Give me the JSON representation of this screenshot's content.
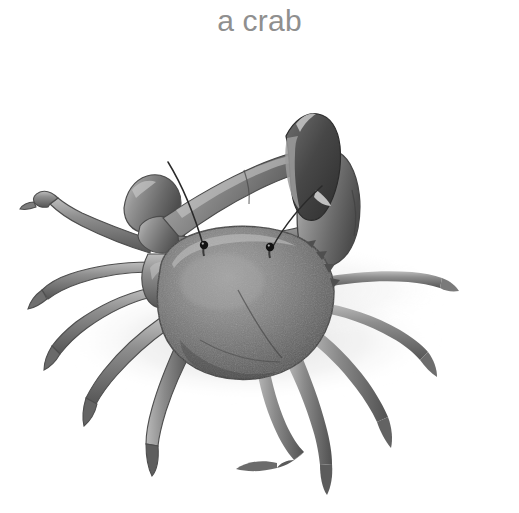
{
  "canvas": {
    "width": 519,
    "height": 513,
    "background_color": "#ffffff"
  },
  "caption": {
    "text": "a crab",
    "color": "#8f8f8f",
    "align": "center",
    "font_size_px": 30
  },
  "illustration": {
    "name": "crab-illustration",
    "subject": "crab",
    "style": "grayscale pencil / airbrush illustration",
    "orientation": "front three-quarter view, one large claw raised",
    "palette": {
      "background": "#ffffff",
      "ground_shadow": "#e9e9e9",
      "body_light": "#b6b6b6",
      "body_mid": "#8c8c8c",
      "body_dark": "#5f5f5f",
      "body_darkest": "#3a3a3a",
      "outline": "#4a4a4a",
      "eye": "#141414",
      "highlight": "#dddddd"
    },
    "parts": [
      {
        "name": "carapace",
        "label": "carapace"
      },
      {
        "name": "large-claw",
        "label": "large claw (chela)"
      },
      {
        "name": "small-claw",
        "label": "small claw"
      },
      {
        "name": "eye-left",
        "label": "left eye"
      },
      {
        "name": "eye-right",
        "label": "right eye"
      },
      {
        "name": "antenna-left",
        "label": "left antenna"
      },
      {
        "name": "antenna-right",
        "label": "right antenna"
      },
      {
        "name": "legs-left",
        "label": "left walking legs",
        "count": 4
      },
      {
        "name": "legs-right",
        "label": "right walking legs",
        "count": 4
      },
      {
        "name": "ground-shadow",
        "label": "ground shadow"
      }
    ]
  }
}
